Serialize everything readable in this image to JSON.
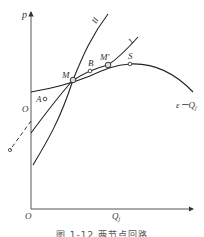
{
  "diagram": {
    "axes": {
      "y_label": "p",
      "x_label": "Q",
      "x_label_subscript": "j",
      "origin_label": "O"
    },
    "curves": [
      {
        "id": "II",
        "label": "II",
        "description": "steep system characteristic line"
      },
      {
        "id": "I",
        "label": "I",
        "description": "less steep system characteristic line"
      },
      {
        "id": "eps",
        "label": "ε－Q",
        "label_subscript": "j",
        "description": "pump head curve with maximum at S"
      },
      {
        "id": "dashed",
        "description": "dashed extension below p-axis intercept O"
      }
    ],
    "points": [
      {
        "label": "M",
        "description": "intersection of curves"
      },
      {
        "label": "M'",
        "description": "operating point on curve I"
      },
      {
        "label": "S",
        "description": "peak of ε－Q curve"
      },
      {
        "label": "A",
        "description": "point on line through O"
      },
      {
        "label": "B",
        "description": "point between M and M'"
      },
      {
        "label": "O",
        "description": "intercept on p-axis"
      }
    ]
  },
  "caption": "图 1-12   两节点回路"
}
